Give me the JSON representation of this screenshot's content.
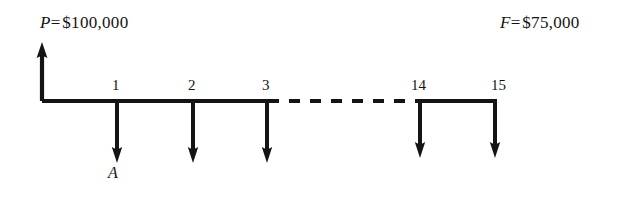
{
  "diagram": {
    "kind": "cash-flow-diagram",
    "title": "",
    "background_color": "#ffffff",
    "ink_color": "#141414",
    "labels": {
      "present_worth": {
        "symbol": "P",
        "equals": "=",
        "value": "$100,000",
        "full": "P = $100,000"
      },
      "future_worth": {
        "symbol": "F",
        "equals": "=",
        "value": "$75,000",
        "full": "F = $75,000"
      },
      "annuity": {
        "symbol": "A",
        "full": "A"
      }
    },
    "timeline": {
      "axis_y": 101,
      "start_x": 42,
      "end_x": 495,
      "solid_segments": [
        [
          42,
          268
        ],
        [
          420,
          495
        ]
      ],
      "dashed_segment": [
        268,
        420
      ],
      "dash_pattern": "10 9"
    },
    "periods": [
      {
        "label": "1",
        "x": 117,
        "flow": "down"
      },
      {
        "label": "2",
        "x": 193,
        "flow": "down"
      },
      {
        "label": "3",
        "x": 267,
        "flow": "down"
      },
      {
        "label": "14",
        "x": 420,
        "flow": "down"
      },
      {
        "label": "15",
        "x": 495,
        "flow": "down"
      }
    ],
    "arrows": {
      "up": [
        {
          "name": "present-worth-arrow",
          "x": 42,
          "from_y": 101,
          "to_y": 45
        }
      ],
      "down": [
        {
          "name": "annuity-arrow-1",
          "x": 117,
          "from_y": 101,
          "to_y": 162
        },
        {
          "name": "annuity-arrow-2",
          "x": 193,
          "from_y": 101,
          "to_y": 162
        },
        {
          "name": "annuity-arrow-3",
          "x": 267,
          "from_y": 101,
          "to_y": 162
        },
        {
          "name": "annuity-arrow-14",
          "x": 420,
          "from_y": 101,
          "to_y": 157
        },
        {
          "name": "annuity-arrow-15",
          "x": 495,
          "from_y": 101,
          "to_y": 157
        }
      ]
    }
  }
}
